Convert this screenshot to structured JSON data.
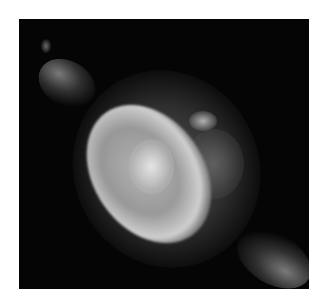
{
  "image": {
    "subject": "planetary nebula",
    "description": "Grayscale astronomical photograph of a planetary nebula with a bright irregular central shell, fainter surrounding halo, and diffuse jets extending toward the upper-left and lower-right corners on a black background",
    "colors": {
      "background": "#050505",
      "page": "#ffffff",
      "shell": "#d7d7d7",
      "halo": "#6e6e6e"
    }
  }
}
